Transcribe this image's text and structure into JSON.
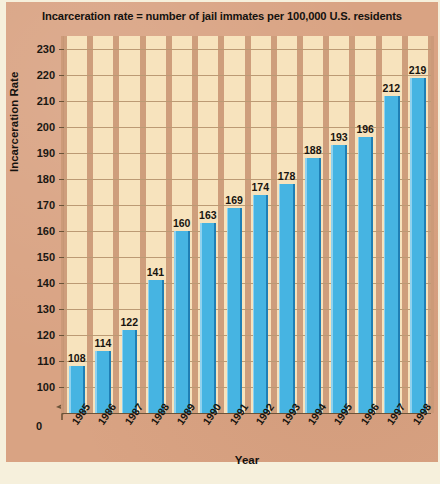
{
  "chart_data": {
    "type": "bar",
    "title": "Incarceration rate = number of jail immates per 100,000 U.S. residents",
    "xlabel": "Year",
    "ylabel": "Incarceration Rate",
    "categories": [
      "1985",
      "1986",
      "1987",
      "1988",
      "1989",
      "1990",
      "1991",
      "1992",
      "1993",
      "1994",
      "1995",
      "1996",
      "1997",
      "1998"
    ],
    "values": [
      108,
      114,
      122,
      141,
      160,
      163,
      169,
      174,
      178,
      188,
      193,
      196,
      212,
      219
    ],
    "ylim": [
      90,
      235
    ],
    "y_ticks": [
      100,
      110,
      120,
      130,
      140,
      150,
      160,
      170,
      180,
      190,
      200,
      210,
      220,
      230
    ],
    "y_zero_label": "0",
    "axis_break": true,
    "grid": true,
    "legend": null,
    "bar_color": "#46b4e2",
    "bar_edge_color": "#1f7fb5",
    "plot_background": "#f7e3bd",
    "panel_background": "#d9a383",
    "gridline_color": "#cb9a78"
  },
  "caption": {
    "footer_text": ""
  }
}
